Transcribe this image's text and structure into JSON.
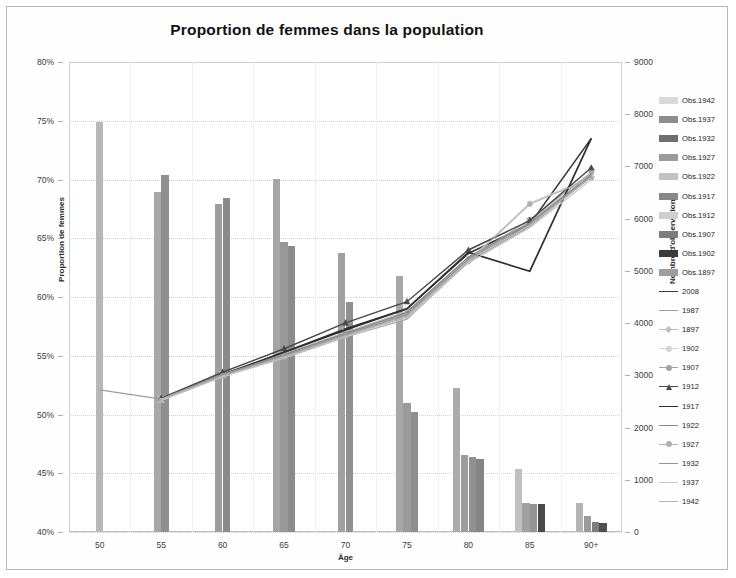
{
  "chart": {
    "title": "Proportion de femmes dans la population",
    "xlabel": "Âge",
    "ylabel_left": "Proportion de femmes",
    "ylabel_right": "Nombre d'observations"
  },
  "axes": {
    "left_ticks": [
      "40%",
      "45%",
      "50%",
      "55%",
      "60%",
      "65%",
      "70%",
      "75%",
      "80%"
    ],
    "right_ticks": [
      "0",
      "1000",
      "2000",
      "3000",
      "4000",
      "5000",
      "6000",
      "7000",
      "8000",
      "9000"
    ],
    "x_ticks": [
      "50",
      "55",
      "60",
      "65",
      "70",
      "75",
      "80",
      "85",
      "90+"
    ]
  },
  "legend": {
    "bars": [
      {
        "label": "Obs.1942",
        "color": "#d9d9d9"
      },
      {
        "label": "Obs.1937",
        "color": "#8d8d8d"
      },
      {
        "label": "Obs.1932",
        "color": "#6e6e6e"
      },
      {
        "label": "Obs.1927",
        "color": "#9a9a9a"
      },
      {
        "label": "Obs.1922",
        "color": "#c2c2c2"
      },
      {
        "label": "Obs.1917",
        "color": "#878787"
      },
      {
        "label": "Obs.1912",
        "color": "#cfcfcf"
      },
      {
        "label": "Obs.1907",
        "color": "#7d7d7d"
      },
      {
        "label": "Obs.1902",
        "color": "#3a3a3a"
      },
      {
        "label": "Obs.1897",
        "color": "#9e9e9e"
      }
    ],
    "lines": [
      {
        "label": "2008",
        "color": "#383838",
        "marker": "none",
        "width": 1.6
      },
      {
        "label": "1987",
        "color": "#9c9c9c",
        "marker": "none",
        "width": 1.2
      },
      {
        "label": "1897",
        "color": "#bdbdbd",
        "marker": "cross",
        "width": 1.1
      },
      {
        "label": "1902",
        "color": "#d2d2d2",
        "marker": "circle",
        "width": 1.1
      },
      {
        "label": "1907",
        "color": "#a3a3a3",
        "marker": "circle",
        "width": 1.1
      },
      {
        "label": "1912",
        "color": "#4a4a4a",
        "marker": "triangle",
        "width": 1.5
      },
      {
        "label": "1917",
        "color": "#2e2e2e",
        "marker": "none",
        "width": 1.7
      },
      {
        "label": "1922",
        "color": "#8a8a8a",
        "marker": "none",
        "width": 1.4
      },
      {
        "label": "1927",
        "color": "#b0b0b0",
        "marker": "circle",
        "width": 1.1
      },
      {
        "label": "1932",
        "color": "#949494",
        "marker": "none",
        "width": 1.3
      },
      {
        "label": "1937",
        "color": "#c6c6c6",
        "marker": "none",
        "width": 1.1
      },
      {
        "label": "1942",
        "color": "#b5b5b5",
        "marker": "none",
        "width": 1.1
      }
    ]
  },
  "chart_data": {
    "type": "bar",
    "title": "Proportion de femmes dans la population",
    "xlabel": "Âge",
    "ylabel": "Proportion de femmes",
    "ylabel_secondary": "Nombre d'observations",
    "categories": [
      "50",
      "55",
      "60",
      "65",
      "70",
      "75",
      "80",
      "85",
      "90+"
    ],
    "ylim": [
      0.4,
      0.8
    ],
    "ylim_secondary": [
      0,
      9000
    ],
    "grid": true,
    "legend_position": "right",
    "bar_series": [
      {
        "name": "Obs.1942",
        "color": "#d9d9d9",
        "axis": "secondary",
        "values": [
          7850,
          null,
          null,
          null,
          null,
          null,
          null,
          null,
          null
        ]
      },
      {
        "name": "Obs.1937",
        "color": "#8d8d8d",
        "axis": "secondary",
        "values": [
          null,
          6520,
          null,
          null,
          null,
          null,
          null,
          null,
          null
        ]
      },
      {
        "name": "Obs.1932",
        "color": "#6e6e6e",
        "axis": "secondary",
        "values": [
          null,
          6830,
          null,
          null,
          null,
          null,
          null,
          null,
          null
        ]
      },
      {
        "name": "Obs.1927",
        "color": "#9a9a9a",
        "axis": "secondary",
        "values": [
          null,
          null,
          6280,
          null,
          null,
          null,
          null,
          null,
          null
        ]
      },
      {
        "name": "Obs.1922",
        "color": "#c2c2c2",
        "axis": "secondary",
        "values": [
          null,
          null,
          6400,
          null,
          null,
          null,
          null,
          null,
          null
        ]
      },
      {
        "name": "Obs.1917",
        "color": "#878787",
        "axis": "secondary",
        "values": [
          null,
          null,
          null,
          6420,
          null,
          null,
          null,
          null,
          null
        ]
      },
      {
        "name": "Obs.1912",
        "color": "#cfcfcf",
        "axis": "secondary",
        "values": [
          null,
          null,
          null,
          5560,
          null,
          null,
          null,
          null,
          null
        ]
      },
      {
        "name": "Obs.1907",
        "color": "#7d7d7d",
        "axis": "secondary",
        "values": [
          null,
          null,
          null,
          5480,
          null,
          null,
          null,
          null,
          null
        ]
      },
      {
        "name": "Obs.1902",
        "color": "#3a3a3a",
        "axis": "secondary",
        "values": [
          null,
          null,
          null,
          null,
          5350,
          null,
          null,
          null,
          null
        ]
      },
      {
        "name": "Obs.1897",
        "color": "#9e9e9e",
        "axis": "secondary",
        "values": [
          null,
          null,
          null,
          null,
          4400,
          null,
          null,
          null,
          null
        ]
      }
    ],
    "bar_groups": [
      {
        "age": "50",
        "bars": [
          {
            "value": 7850,
            "color": "#b8b8b8"
          }
        ]
      },
      {
        "age": "55",
        "bars": [
          {
            "value": 6520,
            "color": "#a8a8a8"
          },
          {
            "value": 6830,
            "color": "#8f8f8f"
          }
        ]
      },
      {
        "age": "60",
        "bars": [
          {
            "value": 6280,
            "color": "#9d9d9d"
          },
          {
            "value": 6400,
            "color": "#8a8a8a"
          }
        ]
      },
      {
        "age": "65",
        "bars": [
          {
            "value": 6760,
            "color": "#a5a5a5"
          },
          {
            "value": 5560,
            "color": "#989898"
          },
          {
            "value": 5480,
            "color": "#8c8c8c"
          }
        ]
      },
      {
        "age": "70",
        "bars": [
          {
            "value": 5350,
            "color": "#a0a0a0"
          },
          {
            "value": 4400,
            "color": "#909090"
          }
        ]
      },
      {
        "age": "75",
        "bars": [
          {
            "value": 4900,
            "color": "#a8a8a8"
          },
          {
            "value": 2480,
            "color": "#9a9a9a"
          },
          {
            "value": 2300,
            "color": "#8e8e8e"
          }
        ]
      },
      {
        "age": "80",
        "bars": [
          {
            "value": 2760,
            "color": "#ababab"
          },
          {
            "value": 1480,
            "color": "#9c9c9c"
          },
          {
            "value": 1430,
            "color": "#909090"
          },
          {
            "value": 1400,
            "color": "#858585"
          }
        ]
      },
      {
        "age": "85",
        "bars": [
          {
            "value": 1200,
            "color": "#c0c0c0"
          },
          {
            "value": 560,
            "color": "#a0a0a0"
          },
          {
            "value": 540,
            "color": "#949494"
          },
          {
            "value": 540,
            "color": "#4a4a4a"
          }
        ]
      },
      {
        "age": "90+",
        "bars": [
          {
            "value": 560,
            "color": "#b4b4b4"
          },
          {
            "value": 300,
            "color": "#9a9a9a"
          },
          {
            "value": 200,
            "color": "#7e7e7e"
          },
          {
            "value": 170,
            "color": "#4f4f4f"
          }
        ]
      }
    ],
    "line_series": [
      {
        "name": "2008",
        "color": "#383838",
        "width": 1.6,
        "marker": "none",
        "values": [
          null,
          0.513,
          0.533,
          0.553,
          0.573,
          0.59,
          0.637,
          0.662,
          0.735
        ]
      },
      {
        "name": "1987",
        "color": "#9c9c9c",
        "width": 1.2,
        "marker": "none",
        "values": [
          0.521,
          0.513,
          0.534,
          0.548,
          0.566,
          0.581,
          0.63,
          0.66,
          0.703
        ]
      },
      {
        "name": "1897",
        "color": "#bdbdbd",
        "width": 1.1,
        "marker": "cross",
        "values": [
          null,
          0.513,
          0.534,
          0.552,
          0.57,
          0.588,
          0.633,
          0.664,
          0.705
        ]
      },
      {
        "name": "1902",
        "color": "#d2d2d2",
        "width": 1.1,
        "marker": "circle",
        "values": [
          null,
          0.512,
          0.535,
          0.55,
          0.568,
          0.585,
          0.631,
          0.68,
          0.702
        ]
      },
      {
        "name": "1907",
        "color": "#a3a3a3",
        "width": 1.1,
        "marker": "circle",
        "values": [
          null,
          0.513,
          0.533,
          0.551,
          0.569,
          0.586,
          0.632,
          0.666,
          0.706
        ]
      },
      {
        "name": "1912",
        "color": "#4a4a4a",
        "width": 1.5,
        "marker": "triangle",
        "values": [
          null,
          0.514,
          0.536,
          0.556,
          0.578,
          0.596,
          0.64,
          0.665,
          0.71
        ]
      },
      {
        "name": "1917",
        "color": "#2e2e2e",
        "width": 1.7,
        "marker": "none",
        "values": [
          null,
          0.513,
          0.534,
          0.553,
          0.572,
          0.59,
          0.638,
          0.622,
          0.735
        ]
      },
      {
        "name": "1922",
        "color": "#8a8a8a",
        "width": 1.4,
        "marker": "none",
        "values": [
          null,
          0.513,
          0.534,
          0.551,
          0.569,
          0.587,
          0.634,
          0.663,
          0.704
        ]
      },
      {
        "name": "1927",
        "color": "#b0b0b0",
        "width": 1.1,
        "marker": "circle",
        "values": [
          null,
          0.512,
          0.533,
          0.549,
          0.567,
          0.584,
          0.63,
          0.679,
          0.701
        ]
      },
      {
        "name": "1932",
        "color": "#949494",
        "width": 1.3,
        "marker": "none",
        "values": [
          null,
          0.513,
          0.534,
          0.55,
          0.568,
          0.585,
          0.632,
          0.662,
          0.703
        ]
      },
      {
        "name": "1937",
        "color": "#c6c6c6",
        "width": 1.1,
        "marker": "none",
        "values": [
          null,
          0.512,
          0.532,
          0.548,
          0.566,
          0.582,
          0.629,
          0.659,
          0.7
        ]
      },
      {
        "name": "1942",
        "color": "#b5b5b5",
        "width": 1.1,
        "marker": "none",
        "values": [
          null,
          0.513,
          0.533,
          0.549,
          0.567,
          0.583,
          0.631,
          0.661,
          0.702
        ]
      }
    ]
  }
}
